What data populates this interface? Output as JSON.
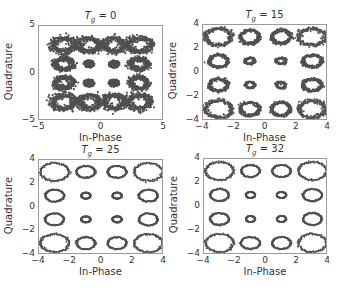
{
  "figure": {
    "background": "#ffffff",
    "marker_color": "#505050",
    "axis_color": "#9a9a9a"
  },
  "chart_data": [
    {
      "type": "scatter",
      "title": "T_g = 0",
      "title_var": "T",
      "title_sub": "g",
      "title_value": "= 0",
      "xlabel": "In-Phase",
      "ylabel": "Quadrature",
      "xlim": [
        -5,
        5
      ],
      "ylim": [
        -5,
        5
      ],
      "xticks": [
        -5,
        0,
        5
      ],
      "yticks": [
        -5,
        0,
        5
      ],
      "grid": false,
      "description": "16-QAM constellation, dense noisy clusters",
      "clusters": [
        {
          "x": -3,
          "y": 3,
          "rx": 0.9,
          "ry": 0.75,
          "style": "noisy-ring"
        },
        {
          "x": -1,
          "y": 3,
          "rx": 0.8,
          "ry": 0.7,
          "style": "noisy-ring"
        },
        {
          "x": 1,
          "y": 3,
          "rx": 0.8,
          "ry": 0.7,
          "style": "noisy-ring"
        },
        {
          "x": 3,
          "y": 3,
          "rx": 0.9,
          "ry": 0.75,
          "style": "noisy-ring"
        },
        {
          "x": -3,
          "y": 1,
          "rx": 0.7,
          "ry": 0.6,
          "style": "noisy-ring"
        },
        {
          "x": -1,
          "y": 1,
          "rx": 0.45,
          "ry": 0.4,
          "style": "blob"
        },
        {
          "x": 1,
          "y": 1,
          "rx": 0.45,
          "ry": 0.4,
          "style": "blob"
        },
        {
          "x": 3,
          "y": 1,
          "rx": 0.7,
          "ry": 0.6,
          "style": "noisy-ring"
        },
        {
          "x": -3,
          "y": -1,
          "rx": 0.7,
          "ry": 0.6,
          "style": "noisy-ring"
        },
        {
          "x": -1,
          "y": -1,
          "rx": 0.45,
          "ry": 0.4,
          "style": "blob"
        },
        {
          "x": 1,
          "y": -1,
          "rx": 0.45,
          "ry": 0.4,
          "style": "blob"
        },
        {
          "x": 3,
          "y": -1,
          "rx": 0.7,
          "ry": 0.6,
          "style": "noisy-ring"
        },
        {
          "x": -3,
          "y": -3,
          "rx": 0.9,
          "ry": 0.75,
          "style": "noisy-ring"
        },
        {
          "x": -1,
          "y": -3,
          "rx": 0.8,
          "ry": 0.7,
          "style": "noisy-ring"
        },
        {
          "x": 1,
          "y": -3,
          "rx": 0.8,
          "ry": 0.7,
          "style": "noisy-ring"
        },
        {
          "x": 3,
          "y": -3,
          "rx": 0.9,
          "ry": 0.75,
          "style": "noisy-ring"
        }
      ]
    },
    {
      "type": "scatter",
      "title": "T_g = 15",
      "title_var": "T",
      "title_sub": "g",
      "title_value": "= 15",
      "xlabel": "In-Phase",
      "ylabel": "Quadrature",
      "xlim": [
        -4,
        4
      ],
      "ylim": [
        -4,
        4
      ],
      "xticks": [
        -4,
        -2,
        0,
        2,
        4
      ],
      "yticks": [
        -4,
        -2,
        0,
        2,
        4
      ],
      "grid": false,
      "description": "16-QAM constellation, ring-shaped clusters with moderate noise",
      "clusters": [
        {
          "x": -3,
          "y": 3,
          "rx": 0.85,
          "ry": 0.7,
          "style": "ring"
        },
        {
          "x": -1,
          "y": 3,
          "rx": 0.6,
          "ry": 0.55,
          "style": "ring"
        },
        {
          "x": 1,
          "y": 3,
          "rx": 0.6,
          "ry": 0.55,
          "style": "ring"
        },
        {
          "x": 3,
          "y": 3,
          "rx": 0.85,
          "ry": 0.7,
          "style": "ring"
        },
        {
          "x": -3,
          "y": 1,
          "rx": 0.6,
          "ry": 0.5,
          "style": "ring"
        },
        {
          "x": -1,
          "y": 1,
          "rx": 0.3,
          "ry": 0.25,
          "style": "small-ring"
        },
        {
          "x": 1,
          "y": 1,
          "rx": 0.3,
          "ry": 0.25,
          "style": "small-ring"
        },
        {
          "x": 3,
          "y": 1,
          "rx": 0.6,
          "ry": 0.5,
          "style": "ring"
        },
        {
          "x": -3,
          "y": -1,
          "rx": 0.6,
          "ry": 0.5,
          "style": "ring"
        },
        {
          "x": -1,
          "y": -1,
          "rx": 0.3,
          "ry": 0.25,
          "style": "small-ring"
        },
        {
          "x": 1,
          "y": -1,
          "rx": 0.3,
          "ry": 0.25,
          "style": "small-ring"
        },
        {
          "x": 3,
          "y": -1,
          "rx": 0.6,
          "ry": 0.5,
          "style": "ring"
        },
        {
          "x": -3,
          "y": -3,
          "rx": 0.85,
          "ry": 0.7,
          "style": "ring"
        },
        {
          "x": -1,
          "y": -3,
          "rx": 0.6,
          "ry": 0.55,
          "style": "ring"
        },
        {
          "x": 1,
          "y": -3,
          "rx": 0.6,
          "ry": 0.55,
          "style": "ring"
        },
        {
          "x": 3,
          "y": -3,
          "rx": 0.85,
          "ry": 0.7,
          "style": "ring"
        }
      ]
    },
    {
      "type": "scatter",
      "title": "T_g = 25",
      "title_var": "T",
      "title_sub": "g",
      "title_value": "= 25",
      "xlabel": "In-Phase",
      "ylabel": "Quadrature",
      "xlim": [
        -4,
        4
      ],
      "ylim": [
        -4,
        4
      ],
      "xticks": [
        -4,
        -2,
        0,
        2,
        4
      ],
      "yticks": [
        -4,
        -2,
        0,
        2,
        4
      ],
      "grid": false,
      "description": "16-QAM constellation, thin clean rings",
      "clusters": [
        {
          "x": -3,
          "y": 3,
          "rx": 0.9,
          "ry": 0.75,
          "style": "thin-ring"
        },
        {
          "x": -1,
          "y": 3,
          "rx": 0.6,
          "ry": 0.5,
          "style": "thin-ring"
        },
        {
          "x": 1,
          "y": 3,
          "rx": 0.6,
          "ry": 0.5,
          "style": "thin-ring"
        },
        {
          "x": 3,
          "y": 3,
          "rx": 0.9,
          "ry": 0.75,
          "style": "thin-ring"
        },
        {
          "x": -3,
          "y": 1,
          "rx": 0.6,
          "ry": 0.5,
          "style": "thin-ring"
        },
        {
          "x": -1,
          "y": 1,
          "rx": 0.3,
          "ry": 0.25,
          "style": "thin-ring"
        },
        {
          "x": 1,
          "y": 1,
          "rx": 0.3,
          "ry": 0.25,
          "style": "thin-ring"
        },
        {
          "x": 3,
          "y": 1,
          "rx": 0.6,
          "ry": 0.5,
          "style": "thin-ring"
        },
        {
          "x": -3,
          "y": -1,
          "rx": 0.6,
          "ry": 0.5,
          "style": "thin-ring"
        },
        {
          "x": -1,
          "y": -1,
          "rx": 0.3,
          "ry": 0.25,
          "style": "thin-ring"
        },
        {
          "x": 1,
          "y": -1,
          "rx": 0.3,
          "ry": 0.25,
          "style": "thin-ring"
        },
        {
          "x": 3,
          "y": -1,
          "rx": 0.6,
          "ry": 0.5,
          "style": "thin-ring"
        },
        {
          "x": -3,
          "y": -3,
          "rx": 0.9,
          "ry": 0.75,
          "style": "thin-ring"
        },
        {
          "x": -1,
          "y": -3,
          "rx": 0.6,
          "ry": 0.5,
          "style": "thin-ring"
        },
        {
          "x": 1,
          "y": -3,
          "rx": 0.6,
          "ry": 0.5,
          "style": "thin-ring"
        },
        {
          "x": 3,
          "y": -3,
          "rx": 0.9,
          "ry": 0.75,
          "style": "thin-ring"
        }
      ]
    },
    {
      "type": "scatter",
      "title": "T_g = 32",
      "title_var": "T",
      "title_sub": "g",
      "title_value": "= 32",
      "xlabel": "In-Phase",
      "ylabel": "Quadrature",
      "xlim": [
        -4,
        4
      ],
      "ylim": [
        -4,
        4
      ],
      "xticks": [
        -4,
        -2,
        0,
        2,
        4
      ],
      "yticks": [
        -4,
        -2,
        0,
        2,
        4
      ],
      "grid": false,
      "description": "16-QAM constellation, thin clean rings",
      "clusters": [
        {
          "x": -3,
          "y": 3,
          "rx": 0.9,
          "ry": 0.75,
          "style": "thin-ring"
        },
        {
          "x": -1,
          "y": 3,
          "rx": 0.6,
          "ry": 0.5,
          "style": "thin-ring"
        },
        {
          "x": 1,
          "y": 3,
          "rx": 0.6,
          "ry": 0.5,
          "style": "thin-ring"
        },
        {
          "x": 3,
          "y": 3,
          "rx": 0.9,
          "ry": 0.75,
          "style": "thin-ring"
        },
        {
          "x": -3,
          "y": 1,
          "rx": 0.6,
          "ry": 0.5,
          "style": "thin-ring"
        },
        {
          "x": -1,
          "y": 1,
          "rx": 0.3,
          "ry": 0.25,
          "style": "thin-ring"
        },
        {
          "x": 1,
          "y": 1,
          "rx": 0.3,
          "ry": 0.25,
          "style": "thin-ring"
        },
        {
          "x": 3,
          "y": 1,
          "rx": 0.6,
          "ry": 0.5,
          "style": "thin-ring"
        },
        {
          "x": -3,
          "y": -1,
          "rx": 0.6,
          "ry": 0.5,
          "style": "thin-ring"
        },
        {
          "x": -1,
          "y": -1,
          "rx": 0.3,
          "ry": 0.25,
          "style": "thin-ring"
        },
        {
          "x": 1,
          "y": -1,
          "rx": 0.3,
          "ry": 0.25,
          "style": "thin-ring"
        },
        {
          "x": 3,
          "y": -1,
          "rx": 0.6,
          "ry": 0.5,
          "style": "thin-ring"
        },
        {
          "x": -3,
          "y": -3,
          "rx": 0.9,
          "ry": 0.75,
          "style": "thin-ring"
        },
        {
          "x": -1,
          "y": -3,
          "rx": 0.6,
          "ry": 0.5,
          "style": "thin-ring"
        },
        {
          "x": 1,
          "y": -3,
          "rx": 0.6,
          "ry": 0.5,
          "style": "thin-ring"
        },
        {
          "x": 3,
          "y": -3,
          "rx": 0.9,
          "ry": 0.75,
          "style": "thin-ring"
        }
      ]
    }
  ],
  "layout": [
    {
      "box": [
        38,
        25,
        125,
        95
      ]
    },
    {
      "box": [
        202,
        24,
        125,
        96
      ]
    },
    {
      "box": [
        38,
        159,
        125,
        95
      ]
    },
    {
      "box": [
        203,
        158,
        124,
        96
      ]
    }
  ]
}
